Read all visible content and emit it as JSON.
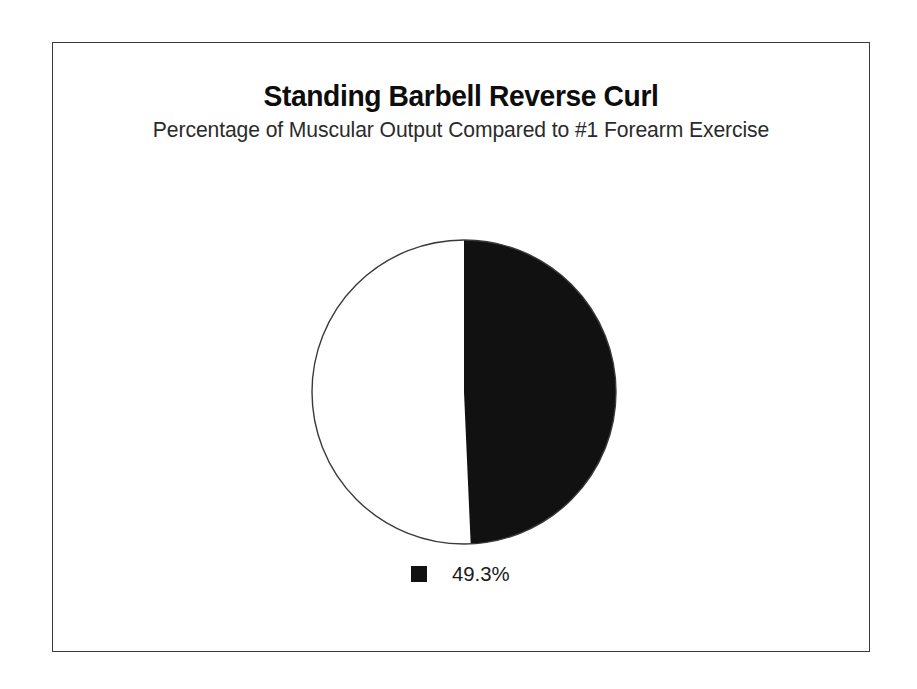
{
  "chart_data": {
    "type": "pie",
    "title": "Standing Barbell Reverse Curl",
    "subtitle": "Percentage of Muscular Output Compared to #1 Forearm Exercise",
    "categories": [
      "49.3%",
      "Remainder"
    ],
    "values": [
      49.3,
      50.7
    ],
    "slice_colors": [
      "#111111",
      "#ffffff"
    ],
    "legend": {
      "position": "bottom",
      "entries": [
        {
          "label": "49.3%",
          "color": "#111111"
        }
      ]
    },
    "start_angle_deg": 0,
    "direction": "clockwise",
    "outline_color": "#3a3a3a",
    "grid": false,
    "xlabel": "",
    "ylabel": ""
  },
  "frame": {
    "border_color": "#3a3a3a",
    "background": "#ffffff"
  }
}
